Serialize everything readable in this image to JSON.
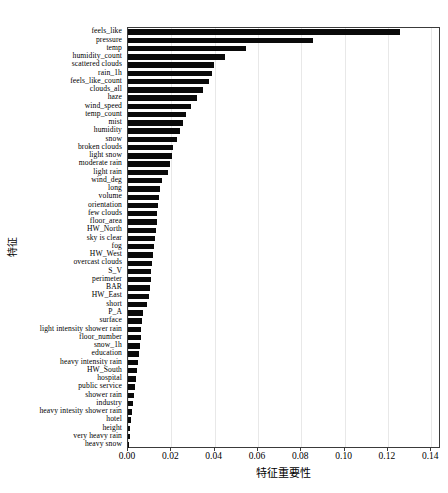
{
  "chart_data": {
    "type": "bar",
    "orientation": "horizontal",
    "title": "",
    "xlabel": "特征重要性",
    "ylabel": "特征",
    "xlim": [
      0.0,
      0.1445
    ],
    "xticks": [
      0.0,
      0.02,
      0.04,
      0.06,
      0.08,
      0.1,
      0.12,
      0.14
    ],
    "xticklabels": [
      "0.00",
      "0.02",
      "0.04",
      "0.06",
      "0.08",
      "0.10",
      "0.12",
      "0.14"
    ],
    "grid": true,
    "grid_axis": "x",
    "legend": null,
    "bar_color": "#0a0a0a",
    "categories": [
      "feels_like",
      "pressure",
      "temp",
      "humidity_count",
      "scattered clouds",
      "rain_1h",
      "feels_like_count",
      "clouds_all",
      "haze",
      "wind_speed",
      "temp_count",
      "mist",
      "humidity",
      "snow",
      "broken clouds",
      "light snow",
      "moderate rain",
      "light rain",
      "wind_deg",
      "long",
      "volume",
      "orientation",
      "few clouds",
      "floor_area",
      "HW_North",
      "sky is clear",
      "fog",
      "HW_West",
      "overcast clouds",
      "S_V",
      "perimeter",
      "BAR",
      "HW_East",
      "short",
      "P_A",
      "surface",
      "light intensity shower rain",
      "floor_number",
      "snow_1h",
      "education",
      "heavy intensity rain",
      "HW_South",
      "hospital",
      "public service",
      "shower rain",
      "industry",
      "heavy intesity shower rain",
      "hotel",
      "height",
      "very heavy rain",
      "heavy snow"
    ],
    "values": [
      0.1255,
      0.0855,
      0.0545,
      0.045,
      0.0395,
      0.039,
      0.0375,
      0.0345,
      0.032,
      0.029,
      0.027,
      0.0255,
      0.024,
      0.0225,
      0.021,
      0.0205,
      0.0195,
      0.0185,
      0.0155,
      0.015,
      0.0145,
      0.014,
      0.0135,
      0.0132,
      0.0128,
      0.0124,
      0.012,
      0.0116,
      0.0112,
      0.0108,
      0.0104,
      0.01,
      0.0096,
      0.009,
      0.007,
      0.0066,
      0.0062,
      0.0058,
      0.0054,
      0.005,
      0.0046,
      0.0042,
      0.0038,
      0.0034,
      0.003,
      0.0022,
      0.0018,
      0.0014,
      0.0011,
      0.0008,
      0.0006
    ]
  }
}
